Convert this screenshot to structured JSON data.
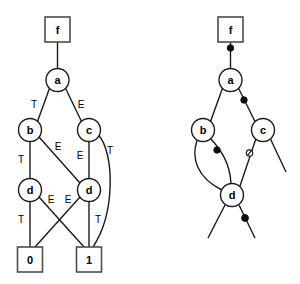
{
  "figure": {
    "title": "",
    "panels": [
      {
        "id": "left-panel",
        "name": "labeled-decision-diagram",
        "nodes": [
          {
            "id": "f",
            "label": "f",
            "shape": "square",
            "x": 57.5,
            "y": 29.5,
            "size": 25
          },
          {
            "id": "a",
            "label": "a",
            "shape": "circle",
            "x": 57.5,
            "y": 80,
            "r": 11.5
          },
          {
            "id": "b",
            "label": "b",
            "shape": "circle",
            "x": 30,
            "y": 130,
            "r": 11.5
          },
          {
            "id": "c",
            "label": "c",
            "shape": "circle",
            "x": 89,
            "y": 130,
            "r": 11.5
          },
          {
            "id": "d1",
            "label": "d",
            "shape": "circle",
            "x": 30,
            "y": 190,
            "r": 11.5
          },
          {
            "id": "d2",
            "label": "d",
            "shape": "circle",
            "x": 89,
            "y": 190,
            "r": 11.5
          },
          {
            "id": "t0",
            "label": "0",
            "shape": "square",
            "x": 30,
            "y": 259.5,
            "size": 25
          },
          {
            "id": "t1",
            "label": "1",
            "shape": "square",
            "x": 89,
            "y": 259.5,
            "size": 25
          }
        ],
        "edges": [
          {
            "from": "f",
            "to": "a",
            "label": "",
            "label_x": 0,
            "label_y": 0
          },
          {
            "from": "a",
            "to": "b",
            "label": "T",
            "label_x": 34,
            "label_y": 104
          },
          {
            "from": "a",
            "to": "c",
            "label": "E",
            "label_x": 81,
            "label_y": 104
          },
          {
            "from": "b",
            "to": "d1",
            "label": "T",
            "label_x": 21,
            "label_y": 159
          },
          {
            "from": "b",
            "to": "d2",
            "label": "E",
            "label_x": 58,
            "label_y": 146
          },
          {
            "from": "c",
            "to": "d2",
            "label": "E",
            "label_x": 80,
            "label_y": 155
          },
          {
            "from": "c",
            "to": "t1",
            "label": "T",
            "label_x": 110,
            "label_y": 150
          },
          {
            "from": "d1",
            "to": "t0",
            "label": "T",
            "label_x": 21,
            "label_y": 219
          },
          {
            "from": "d1",
            "to": "t1",
            "label": "E",
            "label_x": 51,
            "label_y": 199
          },
          {
            "from": "d2",
            "to": "t0",
            "label": "E",
            "label_x": 68,
            "label_y": 199
          },
          {
            "from": "d2",
            "to": "t1",
            "label": "T",
            "label_x": 98,
            "label_y": 219
          }
        ]
      },
      {
        "id": "right-panel",
        "name": "bubble-annotated-diagram",
        "nodes": [
          {
            "id": "rf",
            "label": "f",
            "shape": "square",
            "x": 230.5,
            "y": 29.5,
            "size": 25
          },
          {
            "id": "ra",
            "label": "a",
            "shape": "circle",
            "x": 230.5,
            "y": 80,
            "r": 11.5
          },
          {
            "id": "rb",
            "label": "b",
            "shape": "circle",
            "x": 203,
            "y": 130,
            "r": 11.5
          },
          {
            "id": "rc",
            "label": "c",
            "shape": "circle",
            "x": 263,
            "y": 130,
            "r": 11.5
          },
          {
            "id": "rd",
            "label": "d",
            "shape": "circle",
            "x": 232,
            "y": 195,
            "r": 11.5
          }
        ],
        "markers": [
          {
            "type": "filled-dot",
            "x": 230.5,
            "y": 48,
            "r": 3.2,
            "name": "complement-dot-f-a"
          },
          {
            "type": "filled-dot",
            "x": 244,
            "y": 100,
            "r": 3.2,
            "name": "complement-dot-a-c"
          },
          {
            "type": "filled-dot",
            "x": 217,
            "y": 150,
            "r": 3.2,
            "name": "complement-dot-b-d"
          },
          {
            "type": "open-dot",
            "x": 249.5,
            "y": 153,
            "r": 3.2,
            "name": "regular-dot-c-d"
          },
          {
            "type": "filled-dot",
            "x": 245,
            "y": 218,
            "r": 3.4,
            "name": "complement-dot-d-out"
          }
        ],
        "dangling_edges": [
          {
            "from": "rc",
            "name": "dangling-edge-c-right"
          },
          {
            "from": "rd",
            "name": "dangling-edge-d-left"
          },
          {
            "from": "rd",
            "name": "dangling-edge-d-right"
          }
        ]
      }
    ],
    "colors": {
      "stroke": "#1a1a1a",
      "box_stroke": "#4d4d4d",
      "background": "#ffffff",
      "dot_fill": "#0d0d0d"
    }
  }
}
